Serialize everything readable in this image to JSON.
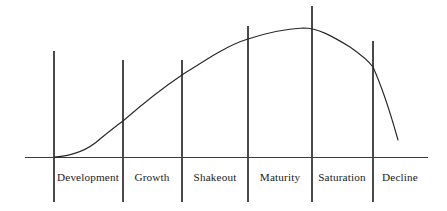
{
  "chart_data": {
    "type": "line",
    "title": "",
    "subtitle": "",
    "xlabel": "",
    "ylabel": "",
    "grid": false,
    "legend": "none",
    "axis": {
      "x_start": 25,
      "x_end": 428,
      "y_baseline": 157,
      "xlim": [
        0,
        447
      ],
      "ylim": [
        0,
        211
      ]
    },
    "categories": [
      "Development",
      "Growth",
      "Shakeout",
      "Maturity",
      "Saturation",
      "Decline"
    ],
    "stage_boundaries_x": [
      54,
      123,
      182,
      248,
      312,
      373,
      428
    ],
    "divider_lines": [
      {
        "x": 54,
        "y_top": 51,
        "y_bottom": 202
      },
      {
        "x": 123,
        "y_top": 60,
        "y_bottom": 202
      },
      {
        "x": 182,
        "y_top": 60,
        "y_bottom": 202
      },
      {
        "x": 248,
        "y_top": 26,
        "y_bottom": 202
      },
      {
        "x": 312,
        "y_top": 6,
        "y_bottom": 202
      },
      {
        "x": 373,
        "y_top": 41,
        "y_bottom": 202
      }
    ],
    "label_positions": [
      {
        "label": "Development",
        "x": 88,
        "y": 181
      },
      {
        "label": "Growth",
        "x": 152,
        "y": 181
      },
      {
        "label": "Shakeout",
        "x": 215,
        "y": 181
      },
      {
        "label": "Maturity",
        "x": 280,
        "y": 181
      },
      {
        "label": "Saturation",
        "x": 342,
        "y": 181
      },
      {
        "label": "Decline",
        "x": 400,
        "y": 181
      }
    ],
    "curve_points": [
      {
        "x": 54,
        "y": 157
      },
      {
        "x": 70,
        "y": 154
      },
      {
        "x": 85,
        "y": 149
      },
      {
        "x": 100,
        "y": 139
      },
      {
        "x": 112,
        "y": 130
      },
      {
        "x": 123,
        "y": 121
      },
      {
        "x": 140,
        "y": 106
      },
      {
        "x": 160,
        "y": 90
      },
      {
        "x": 182,
        "y": 75
      },
      {
        "x": 205,
        "y": 61
      },
      {
        "x": 225,
        "y": 50
      },
      {
        "x": 248,
        "y": 39
      },
      {
        "x": 270,
        "y": 32
      },
      {
        "x": 290,
        "y": 29
      },
      {
        "x": 303,
        "y": 28
      },
      {
        "x": 312,
        "y": 29
      },
      {
        "x": 330,
        "y": 35
      },
      {
        "x": 350,
        "y": 47
      },
      {
        "x": 365,
        "y": 59
      },
      {
        "x": 373,
        "y": 67
      },
      {
        "x": 385,
        "y": 92
      },
      {
        "x": 392,
        "y": 116
      },
      {
        "x": 398,
        "y": 140
      }
    ],
    "curve_path": "M 54,157 C 72,156 88,150 100,139 C 111,130 116,126 123,121 C 146,101 161,89 182,75 C 207,59 228,45 248,39 C 266,33 285,29 303,28 C 318,28 332,36 350,47 C 360,54 368,60 373,67 C 382,87 391,115 398,140",
    "colors": {
      "curve": "#262626",
      "axis": "#3a3a3a",
      "divider": "#4a4a4a",
      "label_text": "#1a1a1a",
      "background": "#ffffff"
    }
  }
}
